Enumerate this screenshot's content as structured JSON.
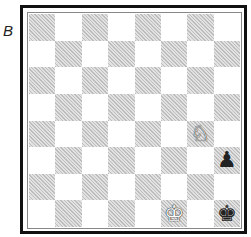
{
  "diagram_label": "B",
  "board": {
    "orientation": "white-bottom",
    "colors": {
      "light": "#ffffff",
      "dark": "#cfcfcf",
      "border": "#111111"
    },
    "pieces": [
      {
        "square": "g4",
        "piece": "knight",
        "color": "white",
        "glyph": "♘"
      },
      {
        "square": "h3",
        "piece": "pawn",
        "color": "black",
        "glyph": "♟"
      },
      {
        "square": "f1",
        "piece": "king",
        "color": "white",
        "glyph": "♔"
      },
      {
        "square": "h1",
        "piece": "king",
        "color": "black",
        "glyph": "♚"
      }
    ]
  }
}
